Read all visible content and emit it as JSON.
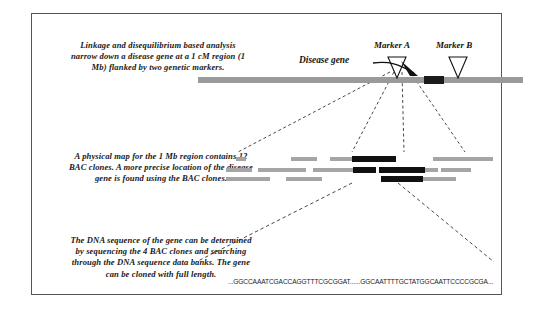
{
  "figure": {
    "captions": {
      "linkage": "Linkage and disequilibrium based analysis narrow down a disease gene at a 1 cM region (1 Mb) flanked by two genetic markers.",
      "physical_map": "A physical map for the 1 Mb region contains 12 BAC clones. A more precise location of the disease gene is found using the BAC clones.",
      "sequencing": "The DNA sequence of the gene can be determined by sequencing the 4 BAC clones and searching through the DNA sequence data banks. The gene can be cloned with full length."
    },
    "chromosome_panel": {
      "marker_a_label": "Marker A",
      "marker_b_label": "Marker B",
      "disease_gene_label": "Disease gene"
    },
    "sequence_panel": {
      "dna_sequence": "...GGCCAAATCGACCAGGTTTCGCGGAT......GGCAATTTTGCTATGGCAATTCCCCGCGA..."
    },
    "colors": {
      "chromosome": "#9a9a9a",
      "disease_gene": "#1b1b1b",
      "bac_light": "#a5a5a5",
      "bac_dark": "#111111",
      "frame": "#555555"
    }
  },
  "chart_data": {
    "type": "diagram",
    "panels": [
      {
        "name": "genetic-linkage-map",
        "features": [
          {
            "label": "chromosome",
            "x_start": 166,
            "x_end": 491
          },
          {
            "label": "Marker A",
            "x": 365
          },
          {
            "label": "Marker B",
            "x": 426
          },
          {
            "label": "disease gene interval",
            "x_start": 392,
            "x_end": 412
          }
        ]
      },
      {
        "name": "physical-map-bac-contig",
        "clone_count": 12,
        "highlighted_clone_count": 4,
        "rows": [
          [
            {
              "x": 236,
              "w": 10,
              "state": "light"
            },
            {
              "x": 291,
              "w": 26,
              "state": "light"
            },
            {
              "x": 330,
              "w": 22,
              "state": "light"
            },
            {
              "x": 352,
              "w": 44,
              "state": "dark"
            },
            {
              "x": 433,
              "w": 60,
              "state": "light"
            }
          ],
          [
            {
              "x": 226,
              "w": 26,
              "state": "light"
            },
            {
              "x": 258,
              "w": 48,
              "state": "light"
            },
            {
              "x": 313,
              "w": 40,
              "state": "light"
            },
            {
              "x": 353,
              "w": 23,
              "state": "dark"
            },
            {
              "x": 379,
              "w": 46,
              "state": "dark"
            },
            {
              "x": 425,
              "w": 13,
              "state": "light"
            },
            {
              "x": 441,
              "w": 30,
              "state": "light"
            }
          ],
          [
            {
              "x": 226,
              "w": 44,
              "state": "light"
            },
            {
              "x": 286,
              "w": 36,
              "state": "light"
            },
            {
              "x": 381,
              "w": 42,
              "state": "dark"
            },
            {
              "x": 423,
              "w": 33,
              "state": "light"
            }
          ]
        ]
      },
      {
        "name": "dna-sequence",
        "sequence": "...GGCCAAATCGACCAGGTTTCGCGGAT......GGCAATTTTGCTATGGCAATTCCCCGCGA..."
      }
    ]
  }
}
